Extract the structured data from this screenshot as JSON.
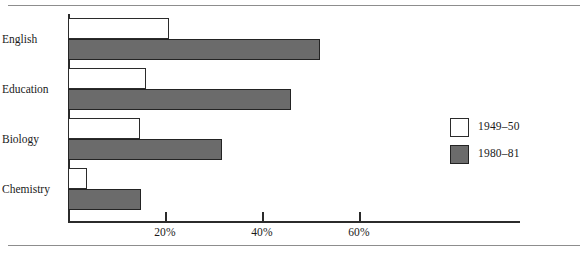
{
  "chart_data": {
    "type": "bar",
    "orientation": "horizontal",
    "title": "",
    "subtitle": "",
    "xlabel": "",
    "ylabel": "",
    "categories": [
      "English",
      "Education",
      "Biology",
      "Chemistry"
    ],
    "series": [
      {
        "name": "1949–50",
        "values": [
          20.8,
          16.0,
          14.8,
          4.0
        ],
        "color": "#ffffff",
        "edge_color": "#2b2b2b"
      },
      {
        "name": "1980–81",
        "values": [
          52.0,
          46.0,
          31.8,
          15.0
        ],
        "color": "#6b6b6b",
        "edge_color": "#232323"
      }
    ],
    "xlim": [
      0,
      72
    ],
    "xticks": [
      20,
      40,
      60
    ],
    "xtick_labels": [
      "20%",
      "40%",
      "60%"
    ],
    "grid": false,
    "legend_position": "right",
    "legend_entries": [
      "1949–50",
      "1980–81"
    ]
  },
  "axis": {
    "ticks": [
      {
        "value": 20,
        "label": "20%"
      },
      {
        "value": 40,
        "label": "40%"
      },
      {
        "value": 60,
        "label": "60%"
      }
    ]
  },
  "categories": [
    {
      "label": "English",
      "light": 20.8,
      "dark": 52.0
    },
    {
      "label": "Education",
      "light": 16.0,
      "dark": 46.0
    },
    {
      "label": "Biology",
      "light": 14.8,
      "dark": 31.8
    },
    {
      "label": "Chemistry",
      "light": 4.0,
      "dark": 15.0
    }
  ],
  "legend": {
    "items": [
      {
        "label": "1949–50",
        "style": "light"
      },
      {
        "label": "1980–81",
        "style": "dark"
      }
    ]
  },
  "colors": {
    "bar_dark": "#6b6b6b",
    "bar_light": "#ffffff",
    "outline": "#2b2b2b",
    "rule": "#8d8d8d",
    "text": "#1a1a1a"
  }
}
